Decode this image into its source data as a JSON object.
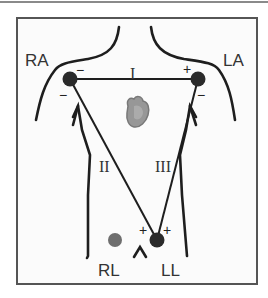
{
  "diagram": {
    "type": "ECG Einthoven triangle limb lead placement",
    "electrodes": [
      {
        "id": "RA",
        "label": "RA",
        "color": "#2a2a2a"
      },
      {
        "id": "LA",
        "label": "LA",
        "color": "#2a2a2a"
      },
      {
        "id": "LL",
        "label": "LL",
        "color": "#2a2a2a"
      },
      {
        "id": "RL",
        "label": "RL",
        "color": "#6e6e6e"
      }
    ],
    "leads": [
      {
        "id": "I",
        "label": "I",
        "from": "RA",
        "to": "LA",
        "negative": "RA",
        "positive": "LA"
      },
      {
        "id": "II",
        "label": "II",
        "from": "RA",
        "to": "LL",
        "negative": "RA",
        "positive": "LL"
      },
      {
        "id": "III",
        "label": "III",
        "from": "LA",
        "to": "LL",
        "negative": "LA",
        "positive": "LL"
      }
    ],
    "signs": {
      "minus": "−",
      "plus": "+"
    },
    "heart_icon": "heart-icon"
  }
}
